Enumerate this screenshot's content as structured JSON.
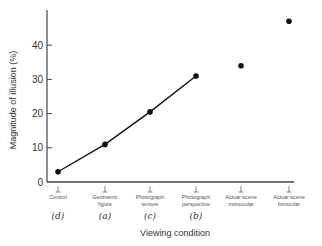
{
  "chart_data": {
    "type": "line",
    "title": "",
    "xlabel": "Viewing condition",
    "ylabel": "Magnitude of illusion (%)",
    "ylim": [
      0,
      48
    ],
    "yticks": [
      0,
      10,
      20,
      30,
      40
    ],
    "grid": false,
    "legend": null,
    "categories": [
      "Control",
      "Geometric figure",
      "Photograph texture",
      "Photograph perspective",
      "Actual scene monocular",
      "Actual scene binocular"
    ],
    "category_lines": [
      [
        "Control"
      ],
      [
        "Geometric",
        "figure"
      ],
      [
        "Photograph",
        "texture"
      ],
      [
        "Photograph",
        "perspective"
      ],
      [
        "Actual scene",
        "monocular"
      ],
      [
        "Actual scene",
        "binocular"
      ]
    ],
    "category_letters": [
      "(d)",
      "(a)",
      "(c)",
      "(b)",
      "",
      ""
    ],
    "values": [
      3,
      11,
      20.5,
      31,
      34,
      47
    ],
    "connected": [
      true,
      true,
      true,
      true,
      false,
      false
    ],
    "marker_color": "#111111",
    "line_color": "#111111"
  }
}
